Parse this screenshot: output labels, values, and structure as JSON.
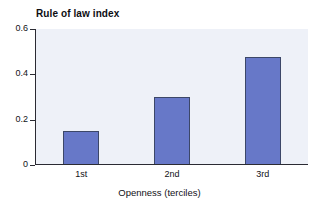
{
  "chart_data": {
    "type": "bar",
    "title": "Rule of law index",
    "panel_label": "(a)",
    "xlabel": "Openness (terciles)",
    "ylabel": "",
    "categories": [
      "1st",
      "2nd",
      "3rd"
    ],
    "values": [
      0.15,
      0.3,
      0.475
    ],
    "ylim": [
      0,
      0.6
    ],
    "yticks": [
      0,
      0.2,
      0.4,
      0.6
    ],
    "ytick_labels": [
      "0",
      "0.2",
      "0.4",
      "0.6"
    ],
    "grid": false,
    "legend": null,
    "bar_color": "#6778c8",
    "bar_edge_color": "#3c4768",
    "plot_background": "#eef1f8",
    "axis_color": "#2b2b33",
    "text_color": "#111116"
  }
}
